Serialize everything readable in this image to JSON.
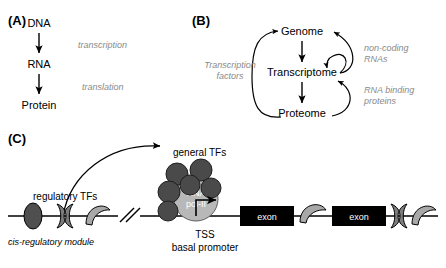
{
  "figure": {
    "width": 446,
    "height": 268,
    "background": "#ffffff"
  },
  "colors": {
    "ink": "#000000",
    "gray_text": "#8a8a8a",
    "tf_dark": "#555555",
    "tf_mid": "#8c8c8c",
    "tf_light": "#bdbdbd",
    "pol_fill": "#b8b8b8",
    "exon_fill": "#000000",
    "exon_text": "#ffffff"
  },
  "panel_a": {
    "label": "(A)",
    "nodes": [
      "DNA",
      "RNA",
      "Protein"
    ],
    "arrow_labels": [
      "transcription",
      "translation"
    ]
  },
  "panel_b": {
    "label": "(B)",
    "nodes": [
      "Genome",
      "Transcriptome",
      "Proteome"
    ],
    "side_labels": {
      "left": "Transcription factors",
      "left_line1": "Transcription",
      "left_line2": "factors",
      "right_top_line1": "non-coding",
      "right_top_line2": "RNAs",
      "right_bottom_line1": "RNA binding",
      "right_bottom_line2": "proteins"
    }
  },
  "panel_c": {
    "label": "(C)",
    "regulatory_tfs_label": "regulatory TFs",
    "cis_module_label": "cis-regulatory module",
    "general_tfs_label": "general TFs",
    "polymerase_line1": "RNA",
    "polymerase_line2": "pol-II",
    "tss_label": "TSS",
    "basal_promoter_label": "basal promoter",
    "exons": [
      "exon",
      "exon"
    ]
  }
}
